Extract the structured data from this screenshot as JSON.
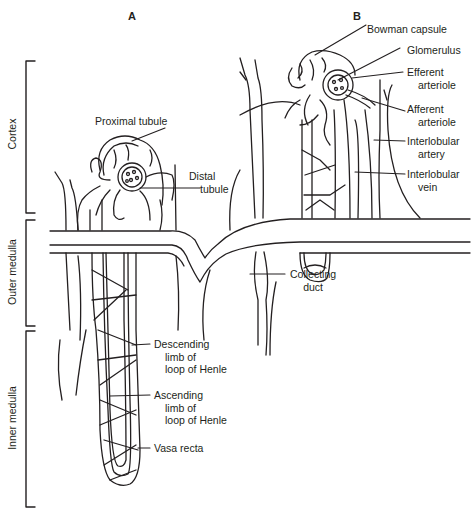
{
  "diagram": {
    "panels": [
      {
        "id": "A",
        "label": "A"
      },
      {
        "id": "B",
        "label": "B"
      }
    ],
    "zones": [
      {
        "label": "Cortex"
      },
      {
        "label": "Outer medulla"
      },
      {
        "label": "Inner medulla"
      }
    ],
    "labels": {
      "proximal_tubule": "Proximal tubule",
      "distal_tubule_1": "Distal",
      "distal_tubule_2": "tubule",
      "bowman_capsule": "Bowman capsule",
      "glomerulus": "Glomerulus",
      "efferent_1": "Efferent",
      "efferent_2": "arteriole",
      "afferent_1": "Afferent",
      "afferent_2": "arteriole",
      "interlobular_artery_1": "Interlobular",
      "interlobular_artery_2": "artery",
      "interlobular_vein_1": "Interlobular",
      "interlobular_vein_2": "vein",
      "collecting_duct_1": "Collecting",
      "collecting_duct_2": "duct",
      "descending_1": "Descending",
      "descending_2": "limb of",
      "descending_3": "loop of Henle",
      "ascending_1": "Ascending",
      "ascending_2": "limb of",
      "ascending_3": "loop of Henle",
      "vasa_recta": "Vasa recta"
    },
    "line_color": "#231f20"
  }
}
